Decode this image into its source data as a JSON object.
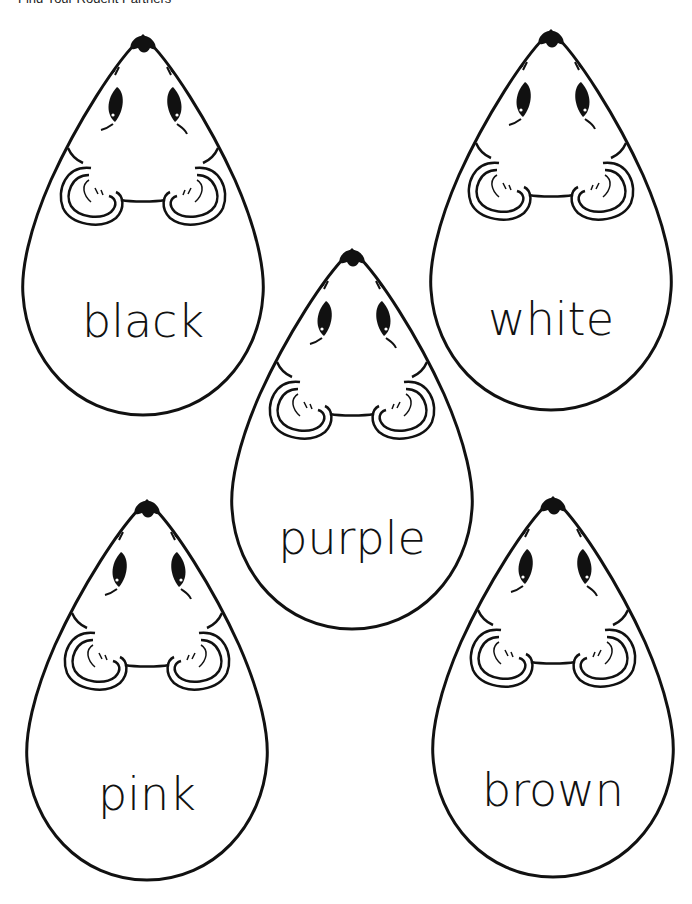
{
  "page": {
    "header": "Find Your Rodent Partners"
  },
  "mice": [
    {
      "label": "black"
    },
    {
      "label": "white"
    },
    {
      "label": "purple"
    },
    {
      "label": "pink"
    },
    {
      "label": "brown"
    }
  ],
  "colors": {
    "ink": "#111111",
    "paper": "#ffffff"
  }
}
